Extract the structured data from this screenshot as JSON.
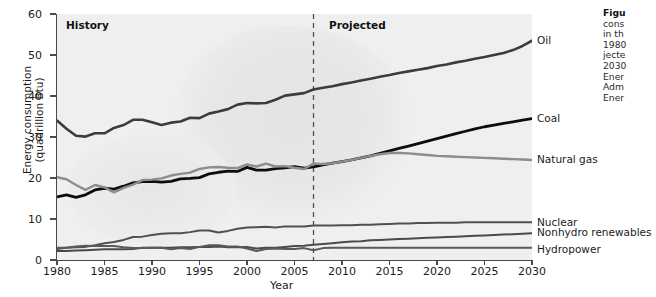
{
  "figure": {
    "axis": {
      "y_title": "Energy consumption\n(quadrillion Btu)",
      "y_title_line1": "Energy consumption",
      "y_title_line2": "(quadrillion Btu)",
      "x_title": "Year",
      "y_ticks": [
        "0",
        "10",
        "20",
        "30",
        "40",
        "50",
        "60"
      ],
      "x_ticks": [
        "1980",
        "1985",
        "1990",
        "1995",
        "2000",
        "2005",
        "2010",
        "2015",
        "2020",
        "2025",
        "2030"
      ]
    },
    "annotations": {
      "history": "History",
      "projected": "Projected"
    },
    "caption": {
      "line1_bold": "Figu",
      "line2": "cons",
      "line3": "in th",
      "line4": "1980",
      "line5": "jecte",
      "line6": "2030",
      "line7": "Ener",
      "line8": "Adm",
      "line9": "Ener"
    }
  },
  "chart_data": {
    "type": "line",
    "title": "",
    "xlabel": "Year",
    "ylabel": "Energy consumption (quadrillion Btu)",
    "xlim": [
      1980,
      2030
    ],
    "ylim": [
      0,
      60
    ],
    "grid": false,
    "legend": "inline-right-labels",
    "divider": {
      "x": 2007,
      "style": "dashed",
      "left_label": "History",
      "right_label": "Projected"
    },
    "x": [
      1980,
      1981,
      1982,
      1983,
      1984,
      1985,
      1986,
      1987,
      1988,
      1989,
      1990,
      1991,
      1992,
      1993,
      1994,
      1995,
      1996,
      1997,
      1998,
      1999,
      2000,
      2001,
      2002,
      2003,
      2004,
      2005,
      2006,
      2007,
      2008,
      2009,
      2010,
      2011,
      2012,
      2013,
      2014,
      2015,
      2016,
      2017,
      2018,
      2019,
      2020,
      2021,
      2022,
      2023,
      2024,
      2025,
      2026,
      2027,
      2028,
      2029,
      2030
    ],
    "series": [
      {
        "name": "Oil",
        "color": "#3c3c3c",
        "label": "Oil",
        "values": [
          34.0,
          32.0,
          30.3,
          30.1,
          30.9,
          30.9,
          32.2,
          32.9,
          34.2,
          34.2,
          33.6,
          32.9,
          33.5,
          33.8,
          34.7,
          34.6,
          35.7,
          36.2,
          36.8,
          37.9,
          38.3,
          38.2,
          38.3,
          39.1,
          40.1,
          40.4,
          40.7,
          41.6,
          42.0,
          42.4,
          42.9,
          43.3,
          43.8,
          44.2,
          44.7,
          45.1,
          45.6,
          46.0,
          46.4,
          46.8,
          47.3,
          47.7,
          48.2,
          48.6,
          49.1,
          49.5,
          50.0,
          50.5,
          51.2,
          52.2,
          53.5
        ]
      },
      {
        "name": "Coal",
        "color": "#0d0d0d",
        "label": "Coal",
        "values": [
          15.4,
          15.9,
          15.3,
          15.9,
          17.1,
          17.5,
          17.3,
          18.0,
          18.8,
          19.1,
          19.2,
          19.0,
          19.2,
          19.8,
          19.9,
          20.1,
          21.0,
          21.4,
          21.7,
          21.6,
          22.6,
          21.9,
          21.9,
          22.3,
          22.5,
          22.8,
          22.4,
          22.7,
          23.2,
          23.6,
          24.0,
          24.4,
          24.9,
          25.4,
          26.0,
          26.6,
          27.2,
          27.8,
          28.4,
          29.0,
          29.6,
          30.2,
          30.8,
          31.4,
          32.0,
          32.5,
          32.9,
          33.3,
          33.7,
          34.1,
          34.5
        ]
      },
      {
        "name": "Natural gas",
        "color": "#8d8d8d",
        "label": "Natural gas",
        "values": [
          20.2,
          19.7,
          18.3,
          17.1,
          18.3,
          17.7,
          16.5,
          17.6,
          18.4,
          19.5,
          19.6,
          19.9,
          20.6,
          21.0,
          21.3,
          22.2,
          22.6,
          22.7,
          22.5,
          22.4,
          23.3,
          22.8,
          23.5,
          22.8,
          22.9,
          22.5,
          22.2,
          23.5,
          23.4,
          23.6,
          24.0,
          24.4,
          24.9,
          25.4,
          25.8,
          26.1,
          26.1,
          26.0,
          25.8,
          25.6,
          25.4,
          25.3,
          25.2,
          25.1,
          25.0,
          24.9,
          24.8,
          24.7,
          24.6,
          24.5,
          24.4
        ]
      },
      {
        "name": "Nuclear",
        "color": "#505050",
        "label": "Nuclear",
        "values": [
          2.7,
          3.0,
          3.1,
          3.2,
          3.6,
          4.1,
          4.4,
          4.9,
          5.6,
          5.7,
          6.1,
          6.4,
          6.5,
          6.5,
          6.8,
          7.2,
          7.2,
          6.7,
          7.1,
          7.6,
          7.9,
          8.0,
          8.1,
          7.9,
          8.2,
          8.2,
          8.2,
          8.4,
          8.4,
          8.4,
          8.5,
          8.5,
          8.6,
          8.6,
          8.7,
          8.8,
          8.9,
          8.9,
          9.0,
          9.0,
          9.1,
          9.1,
          9.1,
          9.2,
          9.2,
          9.2,
          9.2,
          9.2,
          9.2,
          9.2,
          9.2
        ]
      },
      {
        "name": "Nonhydro renewables",
        "color": "#4a4a4a",
        "label": "Nonhydro renewables",
        "values": [
          2.2,
          2.2,
          2.3,
          2.4,
          2.5,
          2.6,
          2.6,
          2.6,
          2.7,
          3.0,
          3.0,
          3.0,
          3.0,
          3.1,
          3.1,
          3.2,
          3.2,
          3.3,
          3.1,
          3.1,
          3.2,
          2.8,
          3.0,
          3.0,
          3.2,
          3.4,
          3.5,
          3.7,
          3.9,
          4.1,
          4.3,
          4.5,
          4.6,
          4.8,
          4.9,
          5.0,
          5.1,
          5.2,
          5.3,
          5.4,
          5.5,
          5.6,
          5.7,
          5.8,
          5.9,
          6.0,
          6.1,
          6.2,
          6.3,
          6.4,
          6.5
        ]
      },
      {
        "name": "Hydropower",
        "color": "#5a5a5a",
        "label": "Hydropower",
        "values": [
          3.0,
          3.0,
          3.3,
          3.5,
          3.4,
          3.4,
          3.4,
          3.1,
          2.9,
          2.9,
          3.0,
          3.0,
          2.6,
          2.9,
          2.7,
          3.2,
          3.6,
          3.6,
          3.3,
          3.3,
          2.8,
          2.2,
          2.7,
          2.8,
          2.7,
          2.7,
          2.9,
          2.4,
          2.9,
          3.0,
          3.0,
          3.0,
          3.0,
          3.0,
          3.0,
          3.0,
          3.0,
          3.0,
          3.0,
          3.0,
          3.0,
          3.0,
          3.0,
          3.0,
          3.0,
          3.0,
          3.0,
          3.0,
          3.0,
          3.0,
          3.0
        ]
      }
    ]
  }
}
